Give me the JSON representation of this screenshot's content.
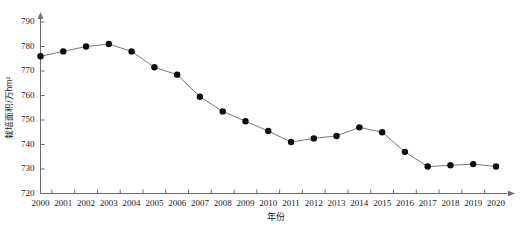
{
  "chart_data": {
    "type": "line",
    "title": "",
    "xlabel": "年份",
    "ylabel": "栽培面积/万hm²",
    "categories": [
      "2000",
      "2001",
      "2002",
      "2003",
      "2004",
      "2005",
      "2006",
      "2007",
      "2008",
      "2009",
      "2010",
      "2011",
      "2012",
      "2013",
      "2014",
      "2015",
      "2016",
      "2017",
      "2018",
      "2019",
      "2020"
    ],
    "values": [
      776,
      778,
      780,
      781,
      778,
      771.5,
      768.5,
      759.5,
      753.5,
      749.5,
      745.5,
      741,
      742.5,
      743.5,
      747,
      745,
      737,
      731,
      731.5,
      732,
      731
    ],
    "x": [
      2000,
      2001,
      2002,
      2003,
      2004,
      2005,
      2006,
      2007,
      2008,
      2009,
      2010,
      2011,
      2012,
      2013,
      2014,
      2015,
      2016,
      2017,
      2018,
      2019,
      2020
    ],
    "ylim": [
      720,
      790
    ],
    "xlim": [
      2000,
      2020
    ],
    "ytick_labels": [
      "720",
      "730",
      "740",
      "750",
      "760",
      "770",
      "780",
      "790"
    ],
    "yticks": [
      720,
      730,
      740,
      750,
      760,
      770,
      780,
      790
    ],
    "xtick_labels": [
      "2000",
      "2001",
      "2002",
      "2003",
      "2004",
      "2005",
      "2006",
      "2007",
      "2008",
      "2009",
      "2010",
      "2011",
      "2012",
      "2013",
      "2014",
      "2015",
      "2016",
      "2017",
      "2018",
      "2019",
      "2020"
    ],
    "grid": false,
    "legend": null,
    "legend_position": "none",
    "marker": "filled-circle",
    "marker_color": "#0d0d0d",
    "line_color": "#7a7a7a",
    "axis_color": "#6e6e6e",
    "series": [
      {
        "name": "栽培面积",
        "values": [
          776,
          778,
          780,
          781,
          778,
          771.5,
          768.5,
          759.5,
          753.5,
          749.5,
          745.5,
          741,
          742.5,
          743.5,
          747,
          745,
          737,
          731,
          731.5,
          732,
          731
        ]
      }
    ]
  }
}
